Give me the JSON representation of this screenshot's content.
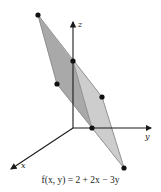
{
  "figure": {
    "caption": "f(x, y) = 2 + 2x − 3y",
    "axes": {
      "x_label": "x",
      "y_label": "y",
      "z_label": "z"
    },
    "colors": {
      "plane_dark": "#a9a9a9",
      "plane_light": "#c9c9c9",
      "edge": "#8a8a8a",
      "axis": "#1a1a1a",
      "point": "#111111"
    },
    "points": [
      {
        "name": "top-vertex",
        "x": 38,
        "y": 15
      },
      {
        "name": "left-vertex",
        "x": 57,
        "y": 84
      },
      {
        "name": "z-intercept",
        "x": 73,
        "y": 61
      },
      {
        "name": "right-vertex",
        "x": 102,
        "y": 97
      },
      {
        "name": "y-intercept",
        "x": 92,
        "y": 128
      },
      {
        "name": "bottom-vertex",
        "x": 124,
        "y": 168
      }
    ]
  }
}
